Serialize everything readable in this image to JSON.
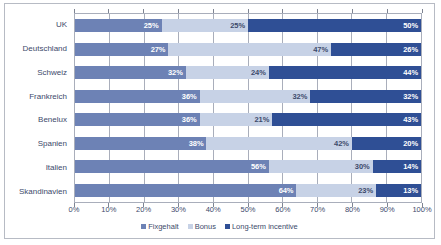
{
  "chart_data": {
    "type": "bar",
    "title": "",
    "subtitle": "",
    "xlabel": "",
    "ylabel": "",
    "orientation": "horizontal",
    "stacked": true,
    "stack_total": 100,
    "grid": true,
    "legend_position": "bottom",
    "xlim": [
      0,
      100
    ],
    "xtick_labels": [
      "0%",
      "10%",
      "20%",
      "30%",
      "40%",
      "50%",
      "60%",
      "70%",
      "80%",
      "90%",
      "100%"
    ],
    "xtick_values": [
      0,
      10,
      20,
      30,
      40,
      50,
      60,
      70,
      80,
      90,
      100
    ],
    "categories": [
      "UK",
      "Deutschland",
      "Schweiz",
      "Frankreich",
      "Benelux",
      "Spanien",
      "Italien",
      "Skandinavien"
    ],
    "series": [
      {
        "name": "Fixgehalt",
        "color": "#6d82b5",
        "values": [
          25,
          27,
          32,
          36,
          36,
          38,
          56,
          64
        ],
        "labels": [
          "25%",
          "27%",
          "32%",
          "36%",
          "36%",
          "38%",
          "56%",
          "64%"
        ]
      },
      {
        "name": "Bonus",
        "color": "#c7d2e6",
        "values": [
          25,
          47,
          24,
          32,
          21,
          42,
          30,
          23
        ],
        "labels": [
          "25%",
          "47%",
          "24%",
          "32%",
          "21%",
          "42%",
          "30%",
          "23%"
        ]
      },
      {
        "name": "Long-term incentive",
        "color": "#2f4f95",
        "values": [
          50,
          26,
          44,
          32,
          43,
          20,
          14,
          13
        ],
        "labels": [
          "50%",
          "26%",
          "44%",
          "32%",
          "43%",
          "20%",
          "14%",
          "13%"
        ]
      }
    ]
  },
  "legend": {
    "items": [
      {
        "label": "Fixgehalt",
        "color": "#6d82b5"
      },
      {
        "label": "Bonus",
        "color": "#c7d2e6"
      },
      {
        "label": "Long-term incentive",
        "color": "#2f4f95"
      }
    ]
  }
}
